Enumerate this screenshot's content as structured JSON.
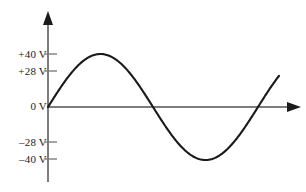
{
  "figure": {
    "name": "sine-waveform-voltage-plot",
    "background": "#ffffff",
    "width": 306,
    "height": 192
  },
  "axes": {
    "color": "#7d7d7d",
    "origin": {
      "x": 48,
      "y": 107
    },
    "vertical": {
      "top": 12,
      "bottom": 182,
      "arrow": "up"
    },
    "horizontal": {
      "left": 48,
      "right": 300,
      "arrow": "right"
    }
  },
  "curve": {
    "color": "#1a1a1a",
    "width": 2.1,
    "description": "sine wave starting at origin, peaking at +40 V, trough at -40 V"
  },
  "y_labels": {
    "plus_forty": "+40 V",
    "plus_twentyeight": "+28 V",
    "zero": "0 V",
    "minus_twentyeight": "–28 V",
    "minus_forty": "–40 V"
  },
  "chart_data": {
    "type": "line",
    "title": "",
    "xlabel": "",
    "ylabel": "",
    "grid": false,
    "legend": null,
    "ylim": [
      -48,
      48
    ],
    "xlim": [
      0,
      1.12
    ],
    "ytick_values": [
      40,
      28,
      0,
      -28,
      -40
    ],
    "ytick_labels": [
      "+40 V",
      "+28 V",
      "0 V",
      "–28 V",
      "–40 V"
    ],
    "xtick_values": [],
    "xtick_labels": [],
    "series": [
      {
        "name": "voltage",
        "function": "40 * sin(2*pi*x)",
        "amplitude": 40,
        "period": 1.0,
        "phase": 0,
        "x": [
          0.0,
          0.05,
          0.1,
          0.15,
          0.2,
          0.25,
          0.3,
          0.35,
          0.4,
          0.45,
          0.5,
          0.55,
          0.6,
          0.65,
          0.7,
          0.75,
          0.8,
          0.85,
          0.9,
          0.95,
          1.0,
          1.05,
          1.1
        ],
        "values": [
          0.0,
          12.4,
          23.5,
          32.4,
          38.0,
          40.0,
          38.0,
          32.4,
          23.5,
          12.4,
          0.0,
          -12.4,
          -23.5,
          -32.4,
          -38.0,
          -40.0,
          -38.0,
          -32.4,
          -23.5,
          -12.4,
          0.0,
          12.4,
          23.5
        ]
      }
    ],
    "annotations": [
      {
        "label": "+40 V",
        "value": 40,
        "note": "positive peak level"
      },
      {
        "label": "+28 V",
        "value": 28,
        "note": "RMS-like reference level"
      },
      {
        "label": "0 V",
        "value": 0,
        "note": "zero / baseline"
      },
      {
        "label": "–28 V",
        "value": -28,
        "note": "negative reference level"
      },
      {
        "label": "–40 V",
        "value": -40,
        "note": "negative peak level"
      }
    ]
  }
}
